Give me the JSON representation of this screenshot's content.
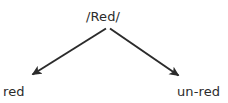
{
  "diagram": {
    "type": "derivation-tree",
    "title_text": "/Red/",
    "canvas": {
      "width": 228,
      "height": 103,
      "background_color": "#ffffff"
    },
    "stroke": {
      "color": "#2b2b2b",
      "width": 2,
      "arrowhead": "solid-triangle"
    },
    "root": {
      "label": "/Red/",
      "x": 107,
      "y": 17
    },
    "branch_point": {
      "x": 108,
      "y": 27
    },
    "branches": [
      {
        "name": "left-branch",
        "label": "red",
        "direction": "down-left",
        "from_x": 105,
        "from_y": 28,
        "to_x": 31,
        "to_y": 74
      },
      {
        "name": "right-branch",
        "label": "un-red",
        "direction": "down-right",
        "from_x": 111,
        "from_y": 28,
        "to_x": 180,
        "to_y": 76
      }
    ],
    "leaves": [
      {
        "name": "left-leaf",
        "label": "red",
        "x": 3,
        "y": 85
      },
      {
        "name": "right-leaf",
        "label": "un-red",
        "x": 177,
        "y": 85
      }
    ]
  }
}
